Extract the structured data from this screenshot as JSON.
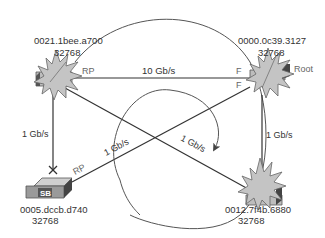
{
  "diagram": {
    "colors": {
      "line": "#333333",
      "switch_fill": "#c8c8c8",
      "switch_dark": "#444444",
      "starburst": "#c4c4c4",
      "label": "#333333",
      "port_label": "#666666"
    },
    "switches": [
      {
        "id": "sa",
        "mac": "0021.1bee.a700",
        "priority": "32768",
        "port_label": "RP"
      },
      {
        "id": "root",
        "mac": "0000.0c39.3127",
        "priority": "32768",
        "role": "Root",
        "port_label_top": "F",
        "port_label_bottom": "F"
      },
      {
        "id": "sb",
        "name": "SB",
        "mac": "0005.dccb.d740",
        "priority": "32768",
        "port_label": "RP"
      },
      {
        "id": "sd",
        "mac": "0012.7f4b.6880",
        "priority": "32768"
      }
    ],
    "links": [
      {
        "from": "sa",
        "to": "root",
        "speed": "10 Gb/s"
      },
      {
        "from": "sa",
        "to": "sb",
        "speed": "1 Gb/s"
      },
      {
        "from": "root",
        "to": "sd",
        "speed": "1 Gb/s"
      },
      {
        "from": "sb",
        "to": "root",
        "speed": "1 Gb/s"
      },
      {
        "from": "sa",
        "to": "sd",
        "speed": "1 Gb/s"
      }
    ]
  }
}
